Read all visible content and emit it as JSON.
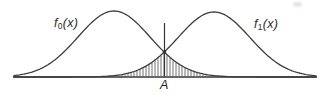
{
  "figure": {
    "background": "#ffffff",
    "curve_stroke": "#3d3d3d",
    "baseline_stroke": "#666666",
    "hatch_stroke": "#444444",
    "threshold_stroke": "#333333"
  },
  "labels": {
    "f0": {
      "base": "f",
      "sub": "0",
      "args": "(x)"
    },
    "f1": {
      "base": "f",
      "sub": "1",
      "args": "(x)"
    },
    "threshold": "A"
  },
  "chart_data": {
    "type": "line",
    "curves": [
      {
        "name": "f0(x)",
        "mean": 114,
        "sigma": 36,
        "peak_top_y": 11
      },
      {
        "name": "f1(x)",
        "mean": 214,
        "sigma": 36,
        "peak_top_y": 12
      }
    ],
    "baseline_y": 77,
    "axis_x_range": [
      13,
      317
    ],
    "threshold_x": 164.5,
    "threshold_top_y": 23,
    "intersection": {
      "x": 164.5,
      "y": 52
    },
    "hatch": {
      "x_start": 119,
      "x_end": 211,
      "spacing": 3
    },
    "grid": false,
    "legend": false
  }
}
